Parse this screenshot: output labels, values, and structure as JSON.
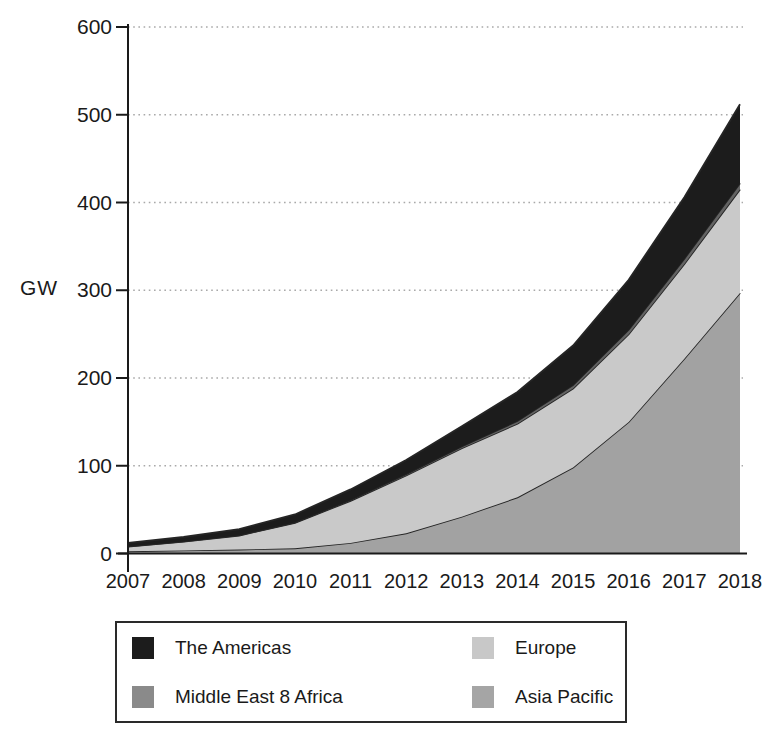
{
  "y_axis_label": "GW",
  "chart_data": {
    "type": "area",
    "stacked": true,
    "title": "",
    "xlabel": "",
    "ylabel": "GW",
    "ylim": [
      0,
      600
    ],
    "y_ticks": [
      0,
      100,
      200,
      300,
      400,
      500,
      600
    ],
    "grid": "dotted-horizontal",
    "legend_position": "bottom",
    "x": [
      "2007",
      "2008",
      "2009",
      "2010",
      "2011",
      "2012",
      "2013",
      "2014",
      "2015",
      "2016",
      "2017",
      "2018"
    ],
    "series": [
      {
        "name": "Asia Pacific",
        "color": "#a5a5a5",
        "area_color": "#a2a2a2",
        "values": [
          2.5,
          3.5,
          4.5,
          6,
          12,
          23,
          42,
          64,
          98,
          150,
          222,
          297
        ]
      },
      {
        "name": "Europe",
        "color": "#c8c8c8",
        "area_color": "#c9c9c9",
        "values": [
          5.5,
          10,
          16,
          29,
          48,
          66,
          78,
          84,
          90,
          100,
          108,
          118
        ]
      },
      {
        "name": "Middle East 8 Africa",
        "color": "#8a8a8a",
        "area_color": "#636363",
        "values": [
          0.2,
          0.3,
          0.4,
          0.5,
          1,
          1.5,
          2,
          3,
          4,
          5,
          6,
          7
        ]
      },
      {
        "name": "The Americas",
        "color": "#1c1c1c",
        "area_color": "#1c1c1c",
        "values": [
          4,
          5,
          7,
          9,
          12,
          16,
          23,
          33,
          45,
          57,
          70,
          90
        ]
      }
    ]
  },
  "legend": {
    "items": [
      {
        "label": "The Americas",
        "color": "#1c1c1c"
      },
      {
        "label": "Europe",
        "color": "#c8c8c8"
      },
      {
        "label": "Middle East 8 Africa",
        "color": "#8a8a8a"
      },
      {
        "label": "Asia Pacific",
        "color": "#a5a5a5"
      }
    ]
  }
}
